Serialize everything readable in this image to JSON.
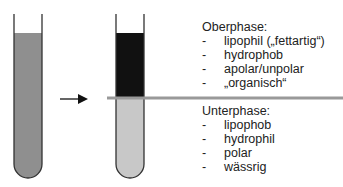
{
  "colors": {
    "mixture": "#8f8f8f",
    "upper_phase": "#111111",
    "lower_phase": "#c8c8c8",
    "divider": "#999999",
    "outline": "#333333"
  },
  "upper_phase": {
    "title": "Oberphase:",
    "items": [
      {
        "dash": "-",
        "text": "lipophil („fettartig“)"
      },
      {
        "dash": "-",
        "text": "hydrophob"
      },
      {
        "dash": "-",
        "text": "apolar/unpolar"
      },
      {
        "dash": "-",
        "text": "„organisch“"
      }
    ]
  },
  "lower_phase": {
    "title": "Unterphase:",
    "items": [
      {
        "dash": "-",
        "text": "lipophob"
      },
      {
        "dash": "-",
        "text": "hydrophil"
      },
      {
        "dash": "-",
        "text": "polar"
      },
      {
        "dash": "-",
        "text": "wässrig"
      }
    ]
  }
}
